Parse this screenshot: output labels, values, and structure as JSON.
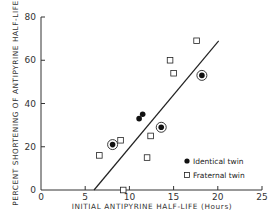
{
  "chart_data": {
    "type": "scatter",
    "title": "",
    "xlabel": "INITIAL ANTIPYRINE HALF-LIFE (Hours)",
    "ylabel": "PERCENT SHORTENING OF ANTIPYRINE HALF-LIFE",
    "xlim": [
      0,
      25
    ],
    "ylim": [
      0,
      80
    ],
    "x_ticks": [
      0,
      5,
      10,
      15,
      20,
      25
    ],
    "y_ticks": [
      0,
      20,
      40,
      60,
      80
    ],
    "x_tick_labels": [
      "0",
      "5",
      "10",
      "15",
      "20",
      "25"
    ],
    "y_tick_labels": [
      "0",
      "20",
      "40",
      "60",
      "80"
    ],
    "grid": false,
    "legend_position": "lower right",
    "series": [
      {
        "name": "Identical twin",
        "marker": "filled-circle",
        "points": [
          {
            "x": 8.1,
            "y": 21,
            "circled": true
          },
          {
            "x": 11.1,
            "y": 33,
            "circled": false
          },
          {
            "x": 11.5,
            "y": 35,
            "circled": false
          },
          {
            "x": 13.6,
            "y": 29,
            "circled": true
          },
          {
            "x": 18.2,
            "y": 53,
            "circled": true
          }
        ]
      },
      {
        "name": "Fraternal twin",
        "marker": "open-square",
        "points": [
          {
            "x": 6.6,
            "y": 16
          },
          {
            "x": 9.0,
            "y": 23
          },
          {
            "x": 9.3,
            "y": 0
          },
          {
            "x": 12.0,
            "y": 15
          },
          {
            "x": 12.4,
            "y": 25
          },
          {
            "x": 14.6,
            "y": 60
          },
          {
            "x": 15.0,
            "y": 54
          },
          {
            "x": 17.6,
            "y": 69
          }
        ]
      }
    ],
    "regression_line": {
      "x1": 6.0,
      "y1": 0,
      "x2": 20.1,
      "y2": 69
    }
  },
  "legend": {
    "items": [
      {
        "label": "Identical twin",
        "marker": "filled-circle"
      },
      {
        "label": "Fraternal twin",
        "marker": "open-square"
      }
    ]
  },
  "axes": {
    "x_title": "INITIAL ANTIPYRINE HALF-LIFE (Hours)",
    "y_title": "PERCENT SHORTENING OF ANTIPYRINE HALF-LIFE"
  }
}
